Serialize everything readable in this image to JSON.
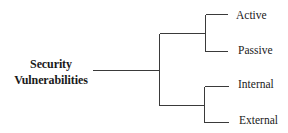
{
  "diagram": {
    "type": "tree",
    "orientation": "left-to-right",
    "root": {
      "label_line1": "Security",
      "label_line2": "Vulnerabilities"
    },
    "branches": [
      {
        "children": [
          {
            "label": "Active"
          },
          {
            "label": "Passive"
          }
        ]
      },
      {
        "children": [
          {
            "label": "Internal"
          },
          {
            "label": "External"
          }
        ]
      }
    ],
    "line_color": "#3a3a3a"
  }
}
